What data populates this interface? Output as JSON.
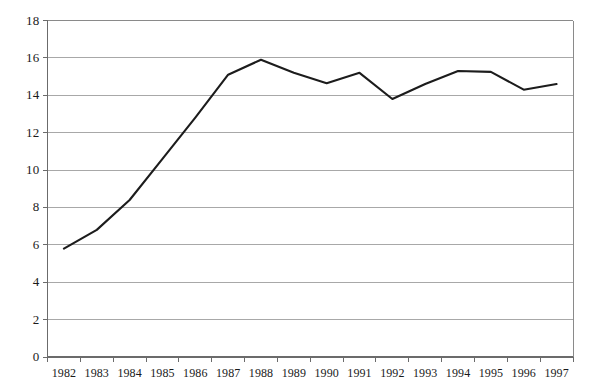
{
  "chart_data": {
    "type": "line",
    "title": "",
    "subtitle": "",
    "xlabel": "",
    "ylabel": "",
    "categories": [
      "1982",
      "1983",
      "1984",
      "1985",
      "1986",
      "1987",
      "1988",
      "1989",
      "1990",
      "1991",
      "1992",
      "1993",
      "1994",
      "1995",
      "1996",
      "1997"
    ],
    "series": [
      {
        "name": "series-1",
        "values": [
          5.8,
          6.8,
          8.4,
          10.6,
          12.8,
          15.1,
          15.9,
          15.2,
          14.65,
          15.2,
          13.8,
          14.6,
          15.3,
          15.25,
          14.3,
          14.6
        ]
      }
    ],
    "ylim": [
      0,
      18
    ],
    "ytick_values": [
      0,
      2,
      4,
      6,
      8,
      10,
      12,
      14,
      16,
      18
    ],
    "ytick_labels": [
      "0",
      "2",
      "4",
      "6",
      "8",
      "10",
      "12",
      "14",
      "16",
      "18"
    ],
    "xtick_labels": [
      "1982",
      "1983",
      "1984",
      "1985",
      "1986",
      "1987",
      "1988",
      "1989",
      "1990",
      "1991",
      "1992",
      "1993",
      "1994",
      "1995",
      "1996",
      "1997"
    ],
    "grid": true,
    "grid_axis": "y",
    "legend": false,
    "legend_position": "none",
    "annotations": [],
    "colors": {
      "line": "#1c1c1c",
      "grid": "#a8a8a8",
      "axis": "#6b6b6b",
      "frame": "#8a8a8a",
      "background": "#ffffff",
      "text": "#1a1a1a"
    }
  }
}
